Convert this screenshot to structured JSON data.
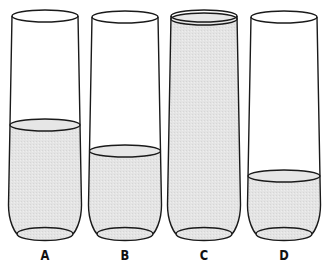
{
  "figure": {
    "colors": {
      "outline": "#1a1a1a",
      "liquid": "#e3e3e3",
      "background": "#ffffff"
    },
    "glasses": [
      {
        "label": "A",
        "fill_level": "about half full",
        "cx": 45,
        "top_y": 16,
        "liquid_y": 125,
        "liquid_full": false
      },
      {
        "label": "B",
        "fill_level": "a little less than half full",
        "cx": 125,
        "top_y": 17,
        "liquid_y": 151,
        "liquid_full": false
      },
      {
        "label": "C",
        "fill_level": "full to the brim",
        "cx": 204,
        "top_y": 16,
        "liquid_y": 19,
        "liquid_full": true
      },
      {
        "label": "D",
        "fill_level": "about one quarter full",
        "cx": 284,
        "top_y": 17,
        "liquid_y": 176,
        "liquid_full": false
      }
    ]
  }
}
